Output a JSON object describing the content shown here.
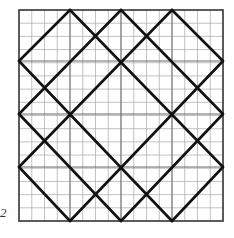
{
  "figure": {
    "label": "2",
    "frame": {
      "x0": 19,
      "y0": 10,
      "x1": 223,
      "y1": 221
    },
    "grid": {
      "minor_divisions": 16
    },
    "nodes_x": [
      19,
      70,
      121,
      172,
      223
    ],
    "nodes_y": [
      10,
      61,
      114,
      167,
      221
    ],
    "colors": {
      "grid": "#9a9a9a",
      "frame": "#333333",
      "bold": "#111111"
    }
  }
}
